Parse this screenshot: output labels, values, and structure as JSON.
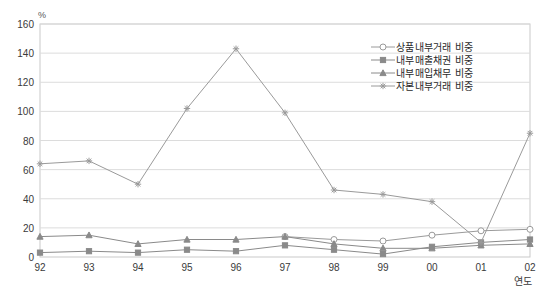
{
  "corner_note": "",
  "unit_label": "%",
  "xaxis_title": "연도",
  "legend": {
    "items": [
      {
        "label": "상품내부거래 비중",
        "marker": "circle-open",
        "color": "#9a9a9a"
      },
      {
        "label": "내부매출채권 비중",
        "marker": "square-filled",
        "color": "#8a8a8a"
      },
      {
        "label": "내부매입채무 비중",
        "marker": "triangle-filled",
        "color": "#8a8a8a"
      },
      {
        "label": "자본내부거래 비중",
        "marker": "star",
        "color": "#9a9a9a"
      }
    ]
  },
  "chart_data": {
    "type": "line",
    "title": "",
    "xlabel": "연도",
    "ylabel": "%",
    "ylim": [
      0,
      160
    ],
    "ytick_step": 20,
    "yticks": [
      0,
      20,
      40,
      60,
      80,
      100,
      120,
      140,
      160
    ],
    "grid": true,
    "legend_position": "top-right",
    "categories": [
      "92",
      "93",
      "94",
      "95",
      "96",
      "97",
      "98",
      "99",
      "00",
      "01",
      "02"
    ],
    "series": [
      {
        "name": "상품내부거래 비중",
        "marker": "circle-open",
        "color": "#9a9a9a",
        "values": [
          null,
          null,
          null,
          null,
          null,
          14,
          12,
          11,
          15,
          18,
          19
        ]
      },
      {
        "name": "내부매출채권 비중",
        "marker": "square-filled",
        "color": "#8a8a8a",
        "values": [
          3,
          4,
          3,
          5,
          4,
          8,
          5,
          2,
          7,
          10,
          12
        ]
      },
      {
        "name": "내부매입채무 비중",
        "marker": "triangle-filled",
        "color": "#8a8a8a",
        "values": [
          14,
          15,
          9,
          12,
          12,
          14,
          9,
          6,
          6,
          8,
          9
        ]
      },
      {
        "name": "자본내부거래 비중",
        "marker": "star",
        "color": "#9a9a9a",
        "values": [
          64,
          66,
          50,
          102,
          143,
          99,
          46,
          43,
          38,
          10,
          85
        ]
      }
    ]
  }
}
